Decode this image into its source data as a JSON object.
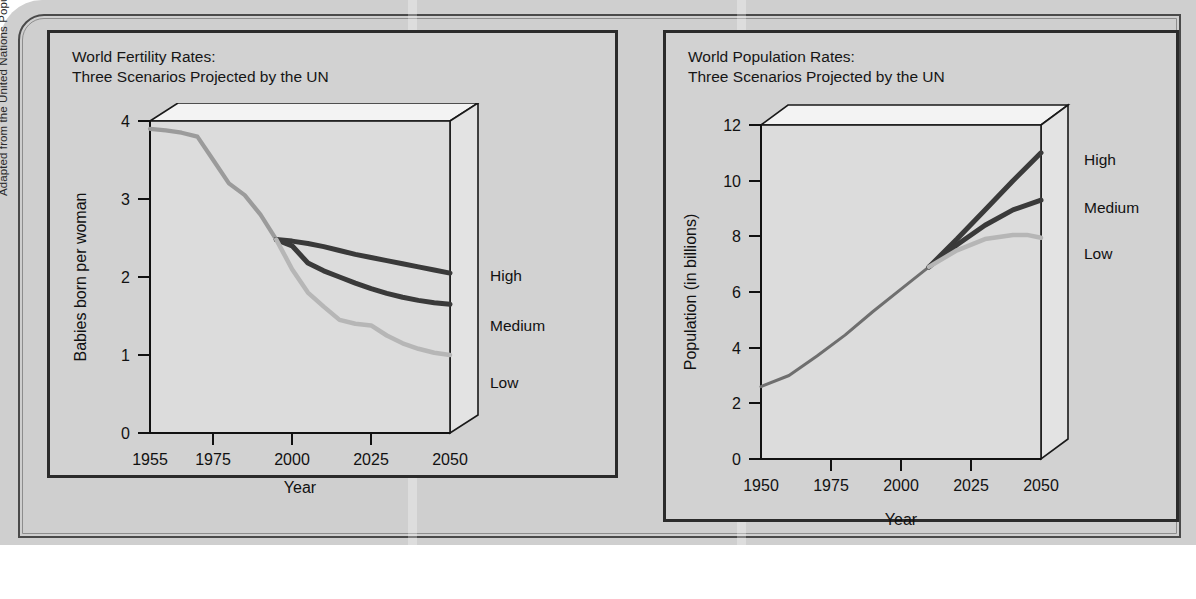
{
  "credit": "Adapted from the United Nations Population Division.",
  "charts": {
    "fertility": {
      "title": "World Fertility Rates:\nThree Scenarios Projected by the UN",
      "ylabel": "Babies born per woman",
      "xlabel": "Year",
      "yticks": [
        "0",
        "1",
        "2",
        "3",
        "4"
      ],
      "xticks": [
        "1955",
        "1975",
        "2000",
        "2025",
        "2050"
      ],
      "series_labels": {
        "high": "High",
        "medium": "Medium",
        "low": "Low"
      }
    },
    "population": {
      "title": "World Population Rates:\nThree Scenarios Projected by the UN",
      "ylabel": "Population (in billions)",
      "xlabel": "Year",
      "yticks": [
        "0",
        "2",
        "4",
        "6",
        "8",
        "10",
        "12"
      ],
      "xticks": [
        "1950",
        "1975",
        "2000",
        "2025",
        "2050"
      ],
      "series_labels": {
        "high": "High",
        "medium": "Medium",
        "low": "Low"
      }
    }
  },
  "colors": {
    "panel_background": "#d2d2d2",
    "page_background": "#cfcfcf",
    "plot_background": "#dcdcdc",
    "line_dark": "#3a3a3a",
    "line_light": "#b6b6b6",
    "line_historical": "#9b9b9b",
    "border": "#2b2b2b"
  },
  "chart_data": [
    {
      "type": "line",
      "id": "world-fertility-rates",
      "title": "World Fertility Rates: Three Scenarios Projected by the UN",
      "xlabel": "Year",
      "ylabel": "Babies born per woman",
      "xlim": [
        1955,
        2050
      ],
      "ylim": [
        0,
        4
      ],
      "xticks": [
        1955,
        1975,
        2000,
        2025,
        2050
      ],
      "yticks": [
        0,
        1,
        2,
        3,
        4
      ],
      "grid": false,
      "legend": "right-of-axis-inline",
      "branch_year": 1995,
      "series": [
        {
          "name": "Historical",
          "x": [
            1955,
            1960,
            1965,
            1970,
            1975,
            1980,
            1985,
            1990,
            1995
          ],
          "values": [
            3.9,
            3.88,
            3.85,
            3.8,
            3.5,
            3.2,
            3.05,
            2.8,
            2.48
          ]
        },
        {
          "name": "High",
          "x": [
            1995,
            2000,
            2005,
            2010,
            2015,
            2020,
            2025,
            2030,
            2035,
            2040,
            2045,
            2050
          ],
          "values": [
            2.48,
            2.46,
            2.43,
            2.39,
            2.34,
            2.29,
            2.25,
            2.21,
            2.17,
            2.13,
            2.09,
            2.05
          ]
        },
        {
          "name": "Medium",
          "x": [
            1995,
            2000,
            2005,
            2010,
            2015,
            2020,
            2025,
            2030,
            2035,
            2040,
            2045,
            2050
          ],
          "values": [
            2.48,
            2.4,
            2.18,
            2.08,
            2.0,
            1.92,
            1.85,
            1.79,
            1.74,
            1.7,
            1.67,
            1.65
          ]
        },
        {
          "name": "Low",
          "x": [
            1995,
            2000,
            2005,
            2010,
            2015,
            2020,
            2025,
            2030,
            2035,
            2040,
            2045,
            2050
          ],
          "values": [
            2.48,
            2.1,
            1.8,
            1.62,
            1.45,
            1.4,
            1.38,
            1.25,
            1.15,
            1.08,
            1.03,
            1.0
          ]
        }
      ]
    },
    {
      "type": "line",
      "id": "world-population-rates",
      "title": "World Population Rates: Three Scenarios Projected by the UN",
      "xlabel": "Year",
      "ylabel": "Population (in billions)",
      "xlim": [
        1950,
        2050
      ],
      "ylim": [
        0,
        12
      ],
      "xticks": [
        1950,
        1975,
        2000,
        2025,
        2050
      ],
      "yticks": [
        0,
        2,
        4,
        6,
        8,
        10,
        12
      ],
      "grid": false,
      "legend": "right-of-axis-inline",
      "branch_year": 2010,
      "series": [
        {
          "name": "Historical",
          "x": [
            1950,
            1960,
            1970,
            1980,
            1990,
            2000,
            2010
          ],
          "values": [
            2.6,
            3.0,
            3.7,
            4.45,
            5.3,
            6.1,
            6.9
          ]
        },
        {
          "name": "High",
          "x": [
            2010,
            2020,
            2030,
            2040,
            2050
          ],
          "values": [
            6.9,
            7.9,
            8.95,
            10.0,
            11.0
          ]
        },
        {
          "name": "Medium",
          "x": [
            2010,
            2020,
            2030,
            2040,
            2050
          ],
          "values": [
            6.9,
            7.7,
            8.4,
            8.95,
            9.3
          ]
        },
        {
          "name": "Low",
          "x": [
            2010,
            2020,
            2030,
            2040,
            2045,
            2050
          ],
          "values": [
            6.9,
            7.5,
            7.9,
            8.05,
            8.05,
            7.95
          ]
        }
      ]
    }
  ]
}
